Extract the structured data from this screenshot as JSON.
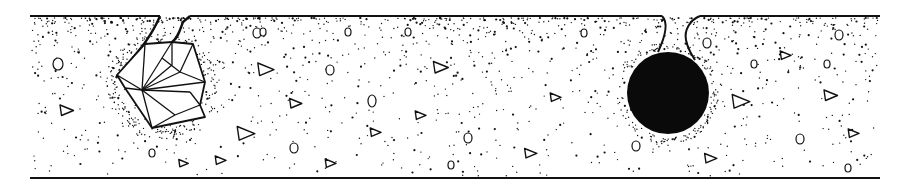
{
  "figure": {
    "width": 903,
    "height": 192,
    "background": "#ffffff",
    "ink_color": "#111111",
    "description_shapes": {
      "top_surface": {
        "y": 16,
        "segments": [
          [
            30,
            160
          ],
          [
            190,
            662
          ],
          [
            700,
            880
          ]
        ]
      },
      "bottom_surface": {
        "y": 178,
        "x1": 30,
        "x2": 880
      },
      "crack_left": {
        "path": "M160,16 C150,40 135,55 118,75 L116,78",
        "path2": "M190,16 L183,22 C180,30 178,38 172,42"
      },
      "notch_right": {
        "path": "M662,16 C668,22 666,35 658,52",
        "path2": "M700,16 C690,20 684,30 686,40 C688,50 692,55 695,60"
      },
      "aggregate_polygon": {
        "outline": [
          [
            117,
            75
          ],
          [
            145,
            44
          ],
          [
            172,
            42
          ],
          [
            193,
            44
          ],
          [
            205,
            82
          ],
          [
            200,
            105
          ],
          [
            205,
            117
          ],
          [
            152,
            128
          ],
          [
            125,
            88
          ]
        ],
        "inner_lines": [
          [
            [
              145,
              44
            ],
            [
              142,
              90
            ]
          ],
          [
            [
              172,
              42
            ],
            [
              162,
              58
            ]
          ],
          [
            [
              162,
              58
            ],
            [
              142,
              90
            ]
          ],
          [
            [
              162,
              58
            ],
            [
              180,
              72
            ]
          ],
          [
            [
              180,
              72
            ],
            [
              193,
              44
            ]
          ],
          [
            [
              180,
              72
            ],
            [
              205,
              82
            ]
          ],
          [
            [
              142,
              90
            ],
            [
              205,
              82
            ]
          ],
          [
            [
              142,
              90
            ],
            [
              180,
              72
            ]
          ],
          [
            [
              117,
              75
            ],
            [
              142,
              90
            ]
          ],
          [
            [
              142,
              90
            ],
            [
              175,
              115
            ]
          ],
          [
            [
              175,
              115
            ],
            [
              200,
              105
            ]
          ],
          [
            [
              175,
              115
            ],
            [
              152,
              128
            ]
          ],
          [
            [
              142,
              90
            ],
            [
              152,
              128
            ]
          ],
          [
            [
              200,
              105
            ],
            [
              190,
              92
            ]
          ],
          [
            [
              190,
              92
            ],
            [
              142,
              90
            ]
          ],
          [
            [
              125,
              88
            ],
            [
              142,
              90
            ]
          ],
          [
            [
              172,
              42
            ],
            [
              172,
              65
            ]
          ],
          [
            [
              172,
              65
            ],
            [
              142,
              90
            ]
          ]
        ]
      },
      "rebar_circle": {
        "cx": 668,
        "cy": 93,
        "r": 41,
        "fill": "#0a0a0a"
      },
      "triangles": [
        [
          265,
          69,
          12
        ],
        [
          66,
          110,
          10
        ],
        [
          245,
          133,
          13
        ],
        [
          295,
          103,
          9
        ],
        [
          375,
          132,
          8
        ],
        [
          220,
          160,
          8
        ],
        [
          440,
          67,
          11
        ],
        [
          555,
          97,
          8
        ],
        [
          420,
          115,
          8
        ],
        [
          330,
          163,
          8
        ],
        [
          530,
          153,
          9
        ],
        [
          740,
          101,
          13
        ],
        [
          830,
          95,
          10
        ],
        [
          853,
          133,
          8
        ],
        [
          710,
          158,
          9
        ],
        [
          785,
          55,
          8
        ],
        [
          183,
          163,
          7
        ]
      ],
      "ovals": [
        [
          58,
          64,
          5,
          6
        ],
        [
          257,
          33,
          4,
          5
        ],
        [
          348,
          32,
          3,
          4
        ],
        [
          408,
          32,
          3,
          4
        ],
        [
          584,
          33,
          3,
          4
        ],
        [
          330,
          70,
          4,
          5
        ],
        [
          372,
          101,
          4,
          6
        ],
        [
          152,
          153,
          3,
          4
        ],
        [
          294,
          148,
          4,
          5
        ],
        [
          468,
          138,
          4,
          5
        ],
        [
          451,
          165,
          3,
          4
        ],
        [
          636,
          146,
          4,
          5
        ],
        [
          707,
          43,
          4,
          5
        ],
        [
          754,
          64,
          3,
          4
        ],
        [
          827,
          64,
          3,
          4
        ],
        [
          800,
          139,
          4,
          5
        ],
        [
          848,
          168,
          3,
          4
        ],
        [
          839,
          35,
          4,
          5
        ],
        [
          263,
          32,
          3,
          4
        ]
      ]
    }
  }
}
